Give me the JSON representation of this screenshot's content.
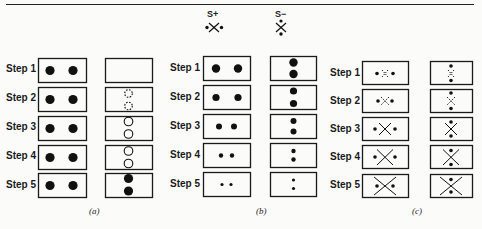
{
  "header": {
    "s_plus_label": "S+",
    "s_minus_label": "S−"
  },
  "steps": [
    "Step 1",
    "Step 2",
    "Step 3",
    "Step 4",
    "Step 5"
  ],
  "panels": [
    {
      "id": "a",
      "caption": "(a)"
    },
    {
      "id": "b",
      "caption": "(b)"
    },
    {
      "id": "c",
      "caption": "(c)"
    }
  ],
  "colors": {
    "ink": "#1a1a1a",
    "background": "#fbfbfa"
  }
}
